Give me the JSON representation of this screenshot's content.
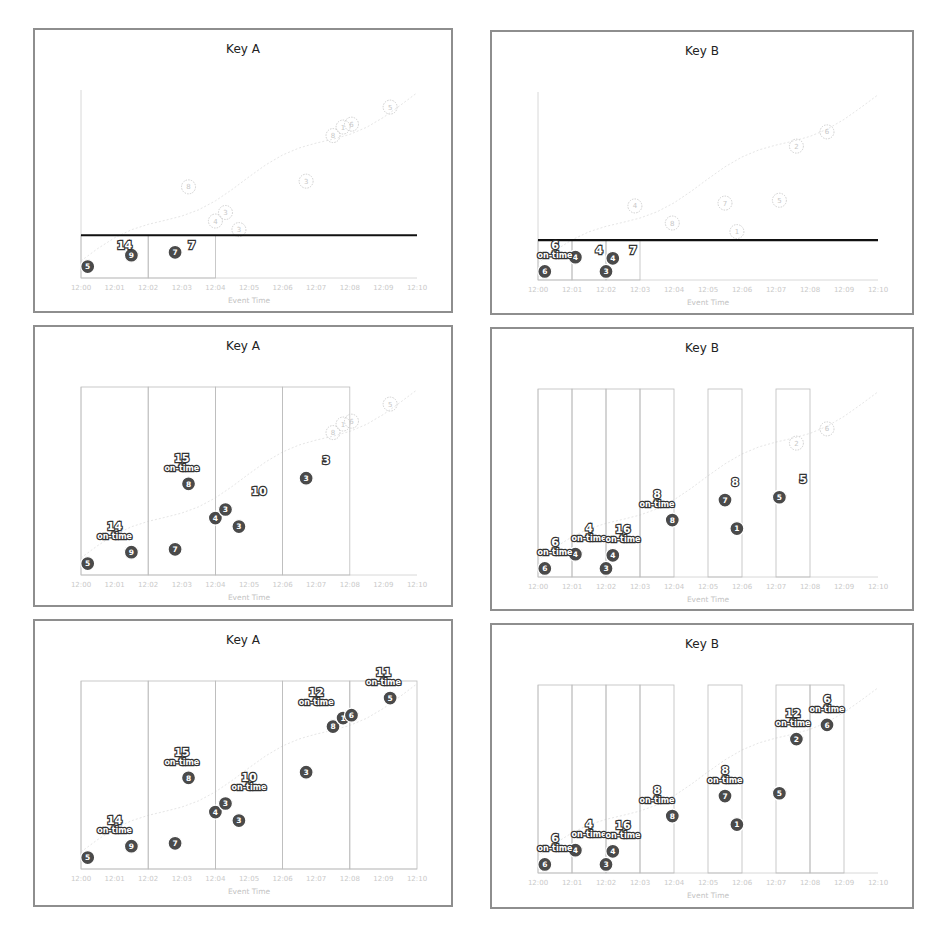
{
  "figure": {
    "panels": [
      {
        "id": "a1",
        "title": "Key A"
      },
      {
        "id": "b1",
        "title": "Key B"
      },
      {
        "id": "a2",
        "title": "Key A"
      },
      {
        "id": "b2",
        "title": "Key B"
      },
      {
        "id": "a3",
        "title": "Key A"
      },
      {
        "id": "b3",
        "title": "Key B"
      }
    ]
  },
  "chart_data": [
    {
      "panel": "a1",
      "type": "scatter",
      "title": "Key A",
      "xlabel": "Event Time",
      "x_ticks": [
        "12:00",
        "12:01",
        "12:02",
        "12:03",
        "12:04",
        "12:05",
        "12:06",
        "12:07",
        "12:08",
        "12:09",
        "12:10"
      ],
      "processing_line_y": 0.75,
      "processed_points": [
        {
          "t": 0.2,
          "y": 0.2,
          "v": 5
        },
        {
          "t": 1.5,
          "y": 0.4,
          "v": 9
        },
        {
          "t": 2.8,
          "y": 0.45,
          "v": 7
        }
      ],
      "future_points": [
        {
          "t": 3.2,
          "y": 1.6,
          "v": 8
        },
        {
          "t": 4.0,
          "y": 1.0,
          "v": 4
        },
        {
          "t": 4.3,
          "y": 1.15,
          "v": 3
        },
        {
          "t": 4.7,
          "y": 0.85,
          "v": 3
        },
        {
          "t": 6.7,
          "y": 1.7,
          "v": 3
        },
        {
          "t": 7.5,
          "y": 2.5,
          "v": 8
        },
        {
          "t": 7.8,
          "y": 2.65,
          "v": 1
        },
        {
          "t": 8.05,
          "y": 2.7,
          "v": 6
        },
        {
          "t": 9.2,
          "y": 3.0,
          "v": 5
        }
      ],
      "window_sums": [
        {
          "window": "12:00-12:02",
          "label": "14"
        },
        {
          "window": "12:02-12:04",
          "label": "7"
        }
      ]
    },
    {
      "panel": "b1",
      "type": "scatter",
      "title": "Key B",
      "xlabel": "Event Time",
      "x_ticks": [
        "12:00",
        "12:01",
        "12:02",
        "12:03",
        "12:04",
        "12:05",
        "12:06",
        "12:07",
        "12:08",
        "12:09",
        "12:10"
      ],
      "processing_line_y": 0.7,
      "processed_points": [
        {
          "t": 0.2,
          "y": 0.15,
          "v": 6
        },
        {
          "t": 1.1,
          "y": 0.4,
          "v": 4
        },
        {
          "t": 2.0,
          "y": 0.15,
          "v": 3
        },
        {
          "t": 2.2,
          "y": 0.38,
          "v": 4
        }
      ],
      "future_points": [
        {
          "t": 2.85,
          "y": 1.3,
          "v": 4
        },
        {
          "t": 3.95,
          "y": 1.0,
          "v": 8
        },
        {
          "t": 5.5,
          "y": 1.35,
          "v": 7
        },
        {
          "t": 5.85,
          "y": 0.85,
          "v": 1
        },
        {
          "t": 7.1,
          "y": 1.4,
          "v": 5
        },
        {
          "t": 7.6,
          "y": 2.35,
          "v": 2
        },
        {
          "t": 8.5,
          "y": 2.6,
          "v": 6
        }
      ],
      "window_sums": [
        {
          "window": "12:00-12:01",
          "label": "6",
          "sub": "on-time"
        },
        {
          "window": "12:01-12:02",
          "label": "4"
        },
        {
          "window": "12:02-12:03",
          "label": "7"
        }
      ]
    },
    {
      "panel": "a2",
      "type": "scatter",
      "title": "Key A",
      "xlabel": "Event Time",
      "x_ticks": [
        "12:00",
        "12:01",
        "12:02",
        "12:03",
        "12:04",
        "12:05",
        "12:06",
        "12:07",
        "12:08",
        "12:09",
        "12:10"
      ],
      "processed_points": [
        {
          "t": 0.2,
          "y": 0.2,
          "v": 5
        },
        {
          "t": 1.5,
          "y": 0.4,
          "v": 9
        },
        {
          "t": 2.8,
          "y": 0.45,
          "v": 7
        },
        {
          "t": 3.2,
          "y": 1.6,
          "v": 8
        },
        {
          "t": 4.0,
          "y": 1.0,
          "v": 4
        },
        {
          "t": 4.3,
          "y": 1.15,
          "v": 3
        },
        {
          "t": 4.7,
          "y": 0.85,
          "v": 3
        },
        {
          "t": 6.7,
          "y": 1.7,
          "v": 3
        }
      ],
      "future_points": [
        {
          "t": 7.5,
          "y": 2.5,
          "v": 8
        },
        {
          "t": 7.8,
          "y": 2.65,
          "v": 1
        },
        {
          "t": 8.05,
          "y": 2.7,
          "v": 6
        },
        {
          "t": 9.2,
          "y": 3.0,
          "v": 5
        }
      ],
      "window_sums": [
        {
          "window": "12:00-12:02",
          "label": "14",
          "sub": "on-time"
        },
        {
          "window": "12:02-12:04",
          "label": "15",
          "sub": "on-time"
        },
        {
          "window": "12:04-12:06",
          "label": "10"
        },
        {
          "window": "12:06-12:08",
          "label": "3"
        }
      ]
    },
    {
      "panel": "b2",
      "type": "scatter",
      "title": "Key B",
      "xlabel": "Event Time",
      "x_ticks": [
        "12:00",
        "12:01",
        "12:02",
        "12:03",
        "12:04",
        "12:05",
        "12:06",
        "12:07",
        "12:08",
        "12:09",
        "12:10"
      ],
      "processed_points": [
        {
          "t": 0.2,
          "y": 0.15,
          "v": 6
        },
        {
          "t": 1.1,
          "y": 0.4,
          "v": 4
        },
        {
          "t": 2.0,
          "y": 0.15,
          "v": 3
        },
        {
          "t": 2.2,
          "y": 0.38,
          "v": 4
        },
        {
          "t": 3.95,
          "y": 1.0,
          "v": 8
        },
        {
          "t": 5.5,
          "y": 1.35,
          "v": 7
        },
        {
          "t": 5.85,
          "y": 0.85,
          "v": 1
        },
        {
          "t": 7.1,
          "y": 1.4,
          "v": 5
        }
      ],
      "future_points": [
        {
          "t": 7.6,
          "y": 2.35,
          "v": 2
        },
        {
          "t": 8.5,
          "y": 2.6,
          "v": 6
        }
      ],
      "window_sums": [
        {
          "window": "12:00-12:01",
          "label": "6",
          "sub": "on-time"
        },
        {
          "window": "12:01-12:02",
          "label": "4",
          "sub": "on-time"
        },
        {
          "window": "12:02-12:03",
          "label": "16",
          "sub": "on-time"
        },
        {
          "window": "12:03-12:04",
          "label": "8",
          "sub": "on-time"
        },
        {
          "window": "12:05-12:06",
          "label": "8"
        },
        {
          "window": "12:07-12:08",
          "label": "5"
        }
      ]
    },
    {
      "panel": "a3",
      "type": "scatter",
      "title": "Key A",
      "xlabel": "Event Time",
      "x_ticks": [
        "12:00",
        "12:01",
        "12:02",
        "12:03",
        "12:04",
        "12:05",
        "12:06",
        "12:07",
        "12:08",
        "12:09",
        "12:10"
      ],
      "processed_points": [
        {
          "t": 0.2,
          "y": 0.2,
          "v": 5
        },
        {
          "t": 1.5,
          "y": 0.4,
          "v": 9
        },
        {
          "t": 2.8,
          "y": 0.45,
          "v": 7
        },
        {
          "t": 3.2,
          "y": 1.6,
          "v": 8
        },
        {
          "t": 4.0,
          "y": 1.0,
          "v": 4
        },
        {
          "t": 4.3,
          "y": 1.15,
          "v": 3
        },
        {
          "t": 4.7,
          "y": 0.85,
          "v": 3
        },
        {
          "t": 6.7,
          "y": 1.7,
          "v": 3
        },
        {
          "t": 7.5,
          "y": 2.5,
          "v": 8
        },
        {
          "t": 7.8,
          "y": 2.65,
          "v": 1
        },
        {
          "t": 8.05,
          "y": 2.7,
          "v": 6
        },
        {
          "t": 9.2,
          "y": 3.0,
          "v": 5
        }
      ],
      "window_sums": [
        {
          "window": "12:00-12:02",
          "label": "14",
          "sub": "on-time"
        },
        {
          "window": "12:02-12:04",
          "label": "15",
          "sub": "on-time"
        },
        {
          "window": "12:04-12:06",
          "label": "10",
          "sub": "on-time"
        },
        {
          "window": "12:06-12:08",
          "label": "12",
          "sub": "on-time"
        },
        {
          "window": "12:08-12:10",
          "label": "11",
          "sub": "on-time"
        }
      ]
    },
    {
      "panel": "b3",
      "type": "scatter",
      "title": "Key B",
      "xlabel": "Event Time",
      "x_ticks": [
        "12:00",
        "12:01",
        "12:02",
        "12:03",
        "12:04",
        "12:05",
        "12:06",
        "12:07",
        "12:08",
        "12:09",
        "12:10"
      ],
      "processed_points": [
        {
          "t": 0.2,
          "y": 0.15,
          "v": 6
        },
        {
          "t": 1.1,
          "y": 0.4,
          "v": 4
        },
        {
          "t": 2.0,
          "y": 0.15,
          "v": 3
        },
        {
          "t": 2.2,
          "y": 0.38,
          "v": 4
        },
        {
          "t": 3.95,
          "y": 1.0,
          "v": 8
        },
        {
          "t": 5.5,
          "y": 1.35,
          "v": 7
        },
        {
          "t": 5.85,
          "y": 0.85,
          "v": 1
        },
        {
          "t": 7.1,
          "y": 1.4,
          "v": 5
        },
        {
          "t": 7.6,
          "y": 2.35,
          "v": 2
        },
        {
          "t": 8.5,
          "y": 2.6,
          "v": 6
        }
      ],
      "window_sums": [
        {
          "window": "12:00-12:01",
          "label": "6",
          "sub": "on-time"
        },
        {
          "window": "12:01-12:02",
          "label": "4",
          "sub": "on-time"
        },
        {
          "window": "12:02-12:03",
          "label": "16",
          "sub": "on-time"
        },
        {
          "window": "12:03-12:04",
          "label": "8",
          "sub": "on-time"
        },
        {
          "window": "12:05-12:06",
          "label": "8",
          "sub": "on-time"
        },
        {
          "window": "12:07-12:08",
          "label": "12",
          "sub": "on-time"
        },
        {
          "window": "12:08-12:09",
          "label": "6",
          "sub": "on-time"
        }
      ]
    }
  ],
  "labels": {
    "x_axis": "Event Time",
    "on_time": "on-time",
    "ticks": [
      "12:00",
      "12:01",
      "12:02",
      "12:03",
      "12:04",
      "12:05",
      "12:06",
      "12:07",
      "12:08",
      "12:09",
      "12:10"
    ]
  },
  "colors": {
    "point": "#4a4a4a",
    "future": "#cfcfcf",
    "border": "#8e8e8e",
    "processing_line": "#111111"
  }
}
